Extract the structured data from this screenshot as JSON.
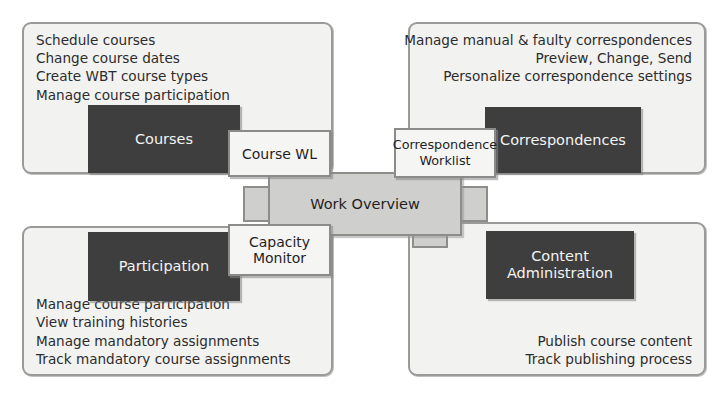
{
  "diagram": {
    "title": "Work Overview",
    "colors": {
      "panel_fill": "#f2f2f0",
      "panel_border": "#9a9a99",
      "dark_block": "#3e3e3e",
      "center_fill": "#cfcfcd",
      "center_border": "#8d8d8c",
      "node_fill": "#f5f5f3",
      "node_border": "#8b8b8a",
      "text": "#2c2c2c"
    }
  },
  "center": {
    "label": "Work Overview"
  },
  "nodes": {
    "course_worklist": {
      "label": "Course WL"
    },
    "correspondence_worklist": {
      "line1": "Correspondence",
      "line2": "Worklist"
    },
    "capacity_monitor": {
      "line1": "Capacity",
      "line2": "Monitor"
    }
  },
  "quadrants": {
    "top_left": {
      "block_label": "Courses",
      "features": [
        "Schedule courses",
        "Change course dates",
        "Create WBT course types",
        "Manage course participation"
      ]
    },
    "top_right": {
      "block_label": "Correspondences",
      "features": [
        "Manage manual & faulty correspondences",
        "Preview, Change, Send",
        "Personalize correspondence settings"
      ]
    },
    "bottom_left": {
      "block_label": "Participation",
      "features": [
        "Manage course participation",
        "View training histories",
        "Manage mandatory assignments",
        "Track mandatory course assignments"
      ]
    },
    "bottom_right": {
      "block_line1": "Content",
      "block_line2": "Administration",
      "features": [
        "Publish course content",
        "Track publishing process"
      ]
    }
  }
}
